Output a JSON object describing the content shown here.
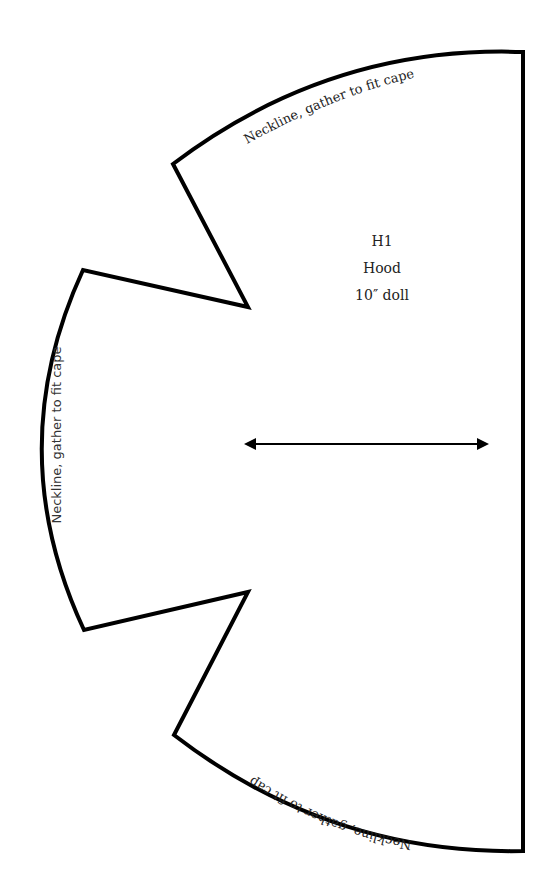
{
  "pattern": {
    "piece_id": "H1",
    "piece_name": "Hood",
    "size": "10″ doll",
    "labels": {
      "top_edge": "Neckline, gather to fit cape",
      "left_edge": "Neckline, gather to fit cape",
      "bottom_edge": "Neckline, gather to fit cape"
    },
    "grainline": "double-headed arrow",
    "outline_color": "#000000"
  }
}
